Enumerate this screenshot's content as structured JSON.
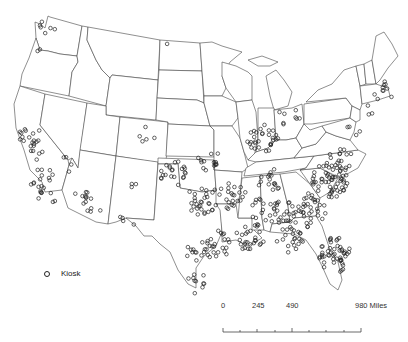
{
  "legend": {
    "items": [
      {
        "symbol": "hollow-circle",
        "label": "Kiosk"
      }
    ]
  },
  "scalebar": {
    "ticks": [
      "0",
      "245",
      "490",
      "980 Miles"
    ],
    "unit": "Miles"
  },
  "colors": {
    "outline": "#444444",
    "marker": "#222222",
    "background": "#ffffff"
  },
  "map": {
    "title": "",
    "region": "Contiguous United States",
    "kiosk_clusters": [
      {
        "name": "Seattle",
        "x": 47,
        "y": 25,
        "n": 6
      },
      {
        "name": "Portland",
        "x": 41,
        "y": 51,
        "n": 2
      },
      {
        "name": "Bay Area",
        "x": 28,
        "y": 135,
        "n": 14
      },
      {
        "name": "Central Valley",
        "x": 36,
        "y": 150,
        "n": 8
      },
      {
        "name": "Los Angeles",
        "x": 42,
        "y": 180,
        "n": 16
      },
      {
        "name": "San Diego",
        "x": 47,
        "y": 196,
        "n": 6
      },
      {
        "name": "Las Vegas",
        "x": 68,
        "y": 164,
        "n": 4
      },
      {
        "name": "Phoenix",
        "x": 85,
        "y": 196,
        "n": 10
      },
      {
        "name": "Tucson",
        "x": 93,
        "y": 210,
        "n": 4
      },
      {
        "name": "Denver",
        "x": 147,
        "y": 134,
        "n": 5
      },
      {
        "name": "Albuquerque",
        "x": 130,
        "y": 183,
        "n": 3
      },
      {
        "name": "El Paso",
        "x": 128,
        "y": 219,
        "n": 4
      },
      {
        "name": "Oklahoma",
        "x": 175,
        "y": 175,
        "n": 22
      },
      {
        "name": "Dallas",
        "x": 203,
        "y": 200,
        "n": 30
      },
      {
        "name": "Houston",
        "x": 218,
        "y": 245,
        "n": 24
      },
      {
        "name": "San Antonio",
        "x": 196,
        "y": 252,
        "n": 12
      },
      {
        "name": "Rio Grande",
        "x": 198,
        "y": 283,
        "n": 10
      },
      {
        "name": "Kansas City",
        "x": 210,
        "y": 160,
        "n": 14
      },
      {
        "name": "Chicago/Indiana",
        "x": 262,
        "y": 138,
        "n": 30
      },
      {
        "name": "Michigan",
        "x": 283,
        "y": 116,
        "n": 4
      },
      {
        "name": "Ohio",
        "x": 296,
        "y": 118,
        "n": 4
      },
      {
        "name": "Arkansas",
        "x": 232,
        "y": 195,
        "n": 22
      },
      {
        "name": "Louisiana",
        "x": 250,
        "y": 238,
        "n": 28
      },
      {
        "name": "Mississippi",
        "x": 262,
        "y": 210,
        "n": 14
      },
      {
        "name": "Tennessee",
        "x": 270,
        "y": 180,
        "n": 16
      },
      {
        "name": "Alabama",
        "x": 285,
        "y": 215,
        "n": 26
      },
      {
        "name": "Georgia",
        "x": 310,
        "y": 210,
        "n": 36
      },
      {
        "name": "Carolinas",
        "x": 330,
        "y": 180,
        "n": 60
      },
      {
        "name": "Virginia",
        "x": 340,
        "y": 160,
        "n": 16
      },
      {
        "name": "Florida Panhandle",
        "x": 290,
        "y": 240,
        "n": 20
      },
      {
        "name": "Florida",
        "x": 335,
        "y": 255,
        "n": 50
      },
      {
        "name": "Boston",
        "x": 383,
        "y": 92,
        "n": 10
      },
      {
        "name": "NYC",
        "x": 366,
        "y": 112,
        "n": 3
      },
      {
        "name": "Baltimore/DC",
        "x": 353,
        "y": 132,
        "n": 4
      },
      {
        "name": "North Dakota",
        "x": 163,
        "y": 46,
        "n": 1
      }
    ]
  }
}
